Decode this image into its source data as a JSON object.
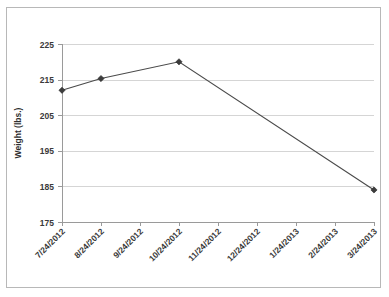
{
  "chart_data": {
    "type": "line",
    "title": "",
    "xlabel": "",
    "ylabel": "Weight (lbs.)",
    "categories": [
      "7/24/2012",
      "8/24/2012",
      "9/24/2012",
      "10/24/2012",
      "11/24/2012",
      "12/24/2012",
      "1/24/2013",
      "2/24/2013",
      "3/24/2013"
    ],
    "x_tick_labels": [
      "7/24/2012",
      "8/24/2012",
      "9/24/2012",
      "10/24/2012",
      "11/24/2012",
      "12/24/2012",
      "1/24/2013",
      "2/24/2013",
      "3/24/2013"
    ],
    "y_tick_labels": [
      "175",
      "185",
      "195",
      "205",
      "215",
      "225"
    ],
    "y_ticks": [
      175,
      185,
      195,
      205,
      215,
      225
    ],
    "ylim": [
      175,
      225
    ],
    "grid": "horizontal",
    "legend": "none",
    "series": [
      {
        "name": "Weight",
        "points": [
          {
            "x": "7/24/2012",
            "x_index": 0,
            "y": 212
          },
          {
            "x": "8/24/2012",
            "x_index": 1,
            "y": 215.3
          },
          {
            "x": "10/24/2012",
            "x_index": 3,
            "y": 220
          },
          {
            "x": "3/24/2013",
            "x_index": 8,
            "y": 184
          }
        ],
        "marker": "diamond",
        "line_color": "#4a4a4a",
        "marker_color": "#3c3c3c"
      }
    ]
  },
  "colors": {
    "background": "#ffffff",
    "border": "#b8b8b8",
    "gridline": "#d5d5d5",
    "axis": "#9a9a9a",
    "text": "#3a3a3a",
    "series": "#4a4a4a"
  },
  "axis": {
    "y_title": "Weight (lbs.)"
  }
}
